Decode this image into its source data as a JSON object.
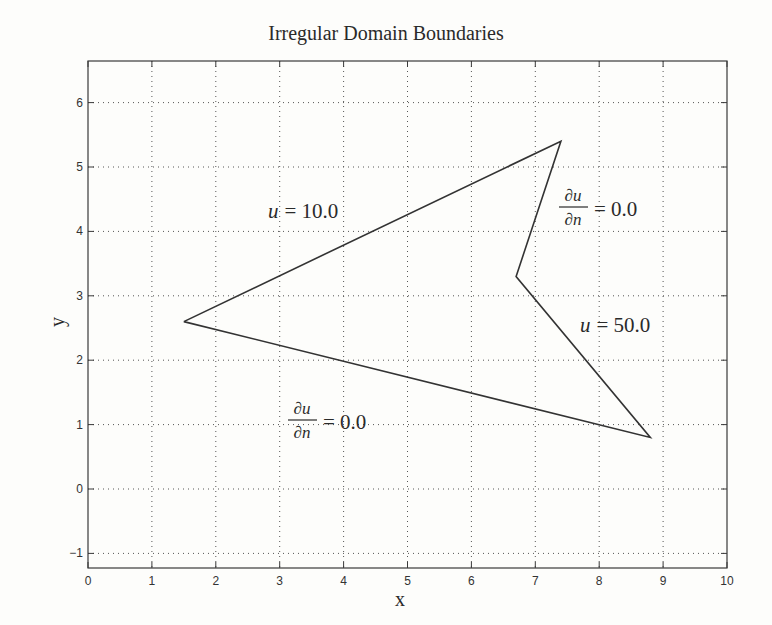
{
  "chart_data": {
    "type": "line",
    "title": "Irregular Domain Boundaries",
    "xlabel": "x",
    "ylabel": "y",
    "xlim": [
      0,
      10
    ],
    "ylim": [
      -1.2,
      6.6
    ],
    "grid": true,
    "grid_style": "dotted",
    "x_ticks": [
      0,
      1,
      2,
      3,
      4,
      5,
      6,
      7,
      8,
      9,
      10
    ],
    "y_ticks": [
      -1,
      0,
      1,
      2,
      3,
      4,
      5,
      6
    ],
    "x_tick_labels": [
      "0",
      "1",
      "2",
      "3",
      "4",
      "5",
      "6",
      "7",
      "8",
      "9",
      "10"
    ],
    "y_tick_labels": [
      "−1",
      "0",
      "1",
      "2",
      "3",
      "4",
      "5",
      "6"
    ],
    "series": [
      {
        "name": "domain boundary (closed polygon)",
        "x": [
          1.5,
          7.4,
          6.7,
          8.8,
          1.5
        ],
        "y": [
          2.6,
          5.4,
          3.3,
          0.8,
          2.6
        ]
      }
    ],
    "annotations": [
      {
        "text": "u = 10.0",
        "x": 3.5,
        "y": 4.4,
        "boundary": "edge (1.5,2.6)-(7.4,5.4)"
      },
      {
        "text": "∂u/∂n = 0.0",
        "x": 7.9,
        "y": 4.1,
        "boundary": "edge (7.4,5.4)-(6.7,3.3)"
      },
      {
        "text": "u = 50.0",
        "x": 8.6,
        "y": 2.5,
        "boundary": "edge (6.7,3.3)-(8.8,0.8)"
      },
      {
        "text": "∂u/∂n = 0.0",
        "x": 4.5,
        "y": 1.2,
        "boundary": "edge (8.8,0.8)-(1.5,2.6)"
      }
    ]
  },
  "labels": {
    "title": "Irregular Domain Boundaries",
    "xlabel": "x",
    "ylabel": "y",
    "ann_top": {
      "lhs": "u",
      "rhs": "= 10.0"
    },
    "ann_right_top": {
      "num": "∂u",
      "den": "∂n",
      "rhs": "= 0.0"
    },
    "ann_right": {
      "lhs": "u",
      "rhs": "= 50.0"
    },
    "ann_bottom": {
      "num": "∂u",
      "den": "∂n",
      "rhs": "= 0.0"
    }
  },
  "colors": {
    "line": "#333333",
    "grid": "#555555",
    "background": "#fdfdfb"
  }
}
